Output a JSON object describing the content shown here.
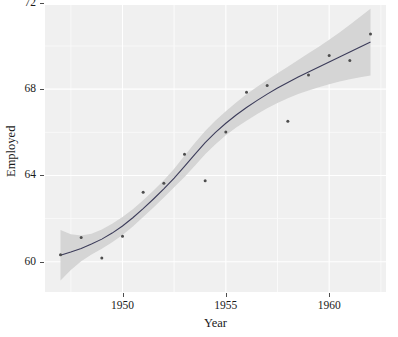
{
  "chart_data": {
    "type": "scatter",
    "title": "",
    "subtitle": "",
    "xlabel": "Year",
    "ylabel": "Employed",
    "xlim": [
      1946.25,
      1962.75
    ],
    "ylim": [
      58.6,
      71.9
    ],
    "xticks": [
      1950,
      1955,
      1960
    ],
    "xtick_labels": [
      "1950",
      "1955",
      "1960"
    ],
    "yticks": [
      60,
      64,
      68,
      72
    ],
    "ytick_labels": [
      "60",
      "64",
      "68",
      "72"
    ],
    "grid": true,
    "legend": false,
    "legend_position": "none",
    "colors": {
      "panel_background": "#f0f0f0",
      "grid_major": "#ffffff",
      "grid_minor": "#fafafa",
      "point": "#4d4d4d",
      "smooth_line": "#3c3c5a",
      "confidence_band": "#d3d3d3",
      "text": "#1a1a1a"
    },
    "series": [
      {
        "name": "Employed",
        "type": "scatter",
        "x": [
          1947,
          1948,
          1949,
          1950,
          1951,
          1952,
          1953,
          1954,
          1955,
          1956,
          1957,
          1958,
          1959,
          1960,
          1961,
          1962
        ],
        "values": [
          60.323,
          61.122,
          60.171,
          61.187,
          63.221,
          63.639,
          64.989,
          63.761,
          66.019,
          67.857,
          68.169,
          66.513,
          68.655,
          69.564,
          69.331,
          70.551
        ]
      },
      {
        "name": "loess smooth",
        "type": "line",
        "x": [
          1947,
          1947.5,
          1948,
          1948.5,
          1949,
          1949.5,
          1950,
          1950.5,
          1951,
          1951.5,
          1952,
          1952.5,
          1953,
          1953.5,
          1954,
          1954.5,
          1955,
          1955.5,
          1956,
          1956.5,
          1957,
          1957.5,
          1958,
          1958.5,
          1959,
          1959.5,
          1960,
          1960.5,
          1961,
          1961.5,
          1962
        ],
        "values": [
          60.3,
          60.45,
          60.62,
          60.82,
          61.05,
          61.33,
          61.66,
          62.04,
          62.46,
          62.91,
          63.38,
          63.88,
          64.42,
          64.98,
          65.52,
          66.0,
          66.42,
          66.8,
          67.15,
          67.47,
          67.77,
          68.05,
          68.31,
          68.56,
          68.8,
          69.03,
          69.26,
          69.49,
          69.72,
          69.95,
          70.18
        ],
        "ci_low": [
          59.13,
          59.62,
          60.02,
          60.34,
          60.6,
          60.9,
          61.24,
          61.64,
          62.07,
          62.52,
          62.98,
          63.45,
          63.93,
          64.45,
          64.98,
          65.45,
          65.86,
          66.22,
          66.54,
          66.84,
          67.11,
          67.36,
          67.58,
          67.77,
          67.94,
          68.09,
          68.23,
          68.35,
          68.46,
          68.55,
          68.63
        ],
        "ci_high": [
          61.47,
          61.28,
          61.22,
          61.3,
          61.5,
          61.76,
          62.08,
          62.44,
          62.85,
          63.3,
          63.78,
          64.31,
          64.91,
          65.51,
          66.06,
          66.55,
          66.98,
          67.38,
          67.76,
          68.1,
          68.43,
          68.74,
          69.04,
          69.35,
          69.66,
          69.97,
          70.29,
          70.63,
          70.98,
          71.35,
          71.73
        ]
      }
    ]
  },
  "axis": {
    "x_label": "Year",
    "y_label": "Employed"
  }
}
